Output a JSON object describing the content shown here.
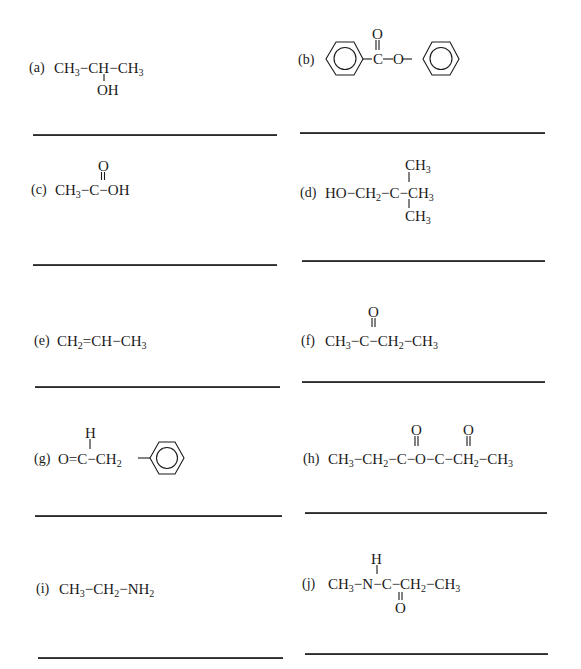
{
  "items": [
    {
      "label": "(a)",
      "main": [
        "CH",
        "3",
        "−",
        "CH",
        "−",
        "CH",
        "3"
      ],
      "below": "OH",
      "name": "isopropyl alcohol"
    },
    {
      "label": "(b)",
      "above": "O",
      "chain": [
        "C",
        "O"
      ],
      "name": "phenyl benzoate"
    },
    {
      "label": "(c)",
      "above": "O",
      "main": [
        "CH",
        "3",
        "−",
        "C",
        "−",
        "OH"
      ],
      "name": "acetic acid"
    },
    {
      "label": "(d)",
      "above": [
        "CH",
        "3"
      ],
      "below": [
        "CH",
        "3"
      ],
      "main": [
        "HO",
        "−",
        "CH",
        "2",
        "−",
        "C",
        "−",
        "CH",
        "3"
      ],
      "name": "neopentyl alcohol"
    },
    {
      "label": "(e)",
      "main": [
        "CH",
        "2",
        "=",
        "CH",
        "−",
        "CH",
        "3"
      ],
      "name": "propene"
    },
    {
      "label": "(f)",
      "above": "O",
      "main": [
        "CH",
        "3",
        "−",
        "C",
        "−",
        "CH",
        "2",
        "−",
        "CH",
        "3"
      ],
      "name": "butanone"
    },
    {
      "label": "(g)",
      "above": "H",
      "main": [
        "O",
        "=",
        "C",
        "−",
        "CH",
        "2"
      ],
      "name": "phenylacetaldehyde"
    },
    {
      "label": "(h)",
      "above": [
        "O",
        "O"
      ],
      "main": [
        "CH",
        "3",
        "−",
        "CH",
        "2",
        "−",
        "C",
        "−",
        "O",
        "−",
        "C",
        "−",
        "CH",
        "2",
        "−",
        "CH",
        "3"
      ],
      "name": "propanoic anhydride"
    },
    {
      "label": "(i)",
      "main": [
        "CH",
        "3",
        "−",
        "CH",
        "2",
        "−",
        "NH",
        "2"
      ],
      "name": "ethylamine"
    },
    {
      "label": "(j)",
      "above": "H",
      "below": "O",
      "main": [
        "CH",
        "3",
        "−",
        "N",
        "−",
        "C",
        "−",
        "CH",
        "2",
        "−",
        "CH",
        "3"
      ],
      "name": "N-methylpropanamide"
    }
  ],
  "answer_lines": 10
}
